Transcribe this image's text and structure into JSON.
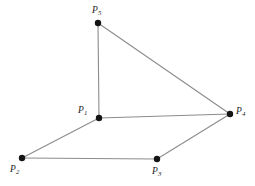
{
  "figure": {
    "background_color": "#ffffff",
    "edge_color": "#8c8c8c",
    "vertex_color": "#141414",
    "label_color": "#1a1a1a",
    "width": 255,
    "height": 186
  },
  "chart_data": {
    "type": "scatter",
    "title": "",
    "xlabel": "",
    "ylabel": "",
    "grid": false,
    "legend": "none",
    "xlim": [
      0,
      255
    ],
    "ylim": [
      186,
      0
    ],
    "nodes": [
      {
        "id": "P1",
        "label_main": "P",
        "label_sub": "1",
        "x": 99,
        "y": 118,
        "label_x": 78,
        "label_y": 106,
        "radius": 3.2
      },
      {
        "id": "P2",
        "label_main": "P",
        "label_sub": "2",
        "x": 22,
        "y": 158,
        "label_x": 10,
        "label_y": 165,
        "radius": 3.2
      },
      {
        "id": "P3",
        "label_main": "P",
        "label_sub": "3",
        "x": 157,
        "y": 159,
        "label_x": 152,
        "label_y": 167,
        "radius": 3.2
      },
      {
        "id": "P4",
        "label_main": "P",
        "label_sub": "4",
        "x": 230,
        "y": 114,
        "label_x": 236,
        "label_y": 107,
        "radius": 3.2
      },
      {
        "id": "P5",
        "label_main": "P",
        "label_sub": "5",
        "x": 98,
        "y": 23,
        "label_x": 92,
        "label_y": 6,
        "radius": 3.2
      }
    ],
    "edges": [
      {
        "id": "edge-p5-p1",
        "from": "P5",
        "x1": 98,
        "y1": 23,
        "to": "P1",
        "x2": 99,
        "y2": 118
      },
      {
        "id": "edge-p5-p4",
        "from": "P5",
        "x1": 98,
        "y1": 23,
        "to": "P4",
        "x2": 230,
        "y2": 114
      },
      {
        "id": "edge-p1-p4",
        "from": "P1",
        "x1": 99,
        "y1": 118,
        "to": "P4",
        "x2": 230,
        "y2": 114
      },
      {
        "id": "edge-p1-p2",
        "from": "P1",
        "x1": 99,
        "y1": 118,
        "to": "P2",
        "x2": 22,
        "y2": 158
      },
      {
        "id": "edge-p2-p3",
        "from": "P2",
        "x1": 22,
        "y1": 158,
        "to": "P3",
        "x2": 157,
        "y2": 159
      },
      {
        "id": "edge-p3-p4",
        "from": "P3",
        "x1": 157,
        "y1": 159,
        "to": "P4",
        "x2": 230,
        "y2": 114
      }
    ]
  }
}
